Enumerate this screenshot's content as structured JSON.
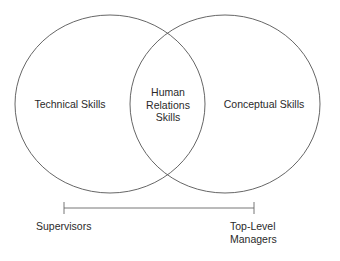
{
  "diagram": {
    "type": "venn",
    "circles": [
      {
        "id": "left",
        "label": "Technical Skills"
      },
      {
        "id": "right",
        "label": "Conceptual Skills"
      }
    ],
    "intersection": {
      "lines": [
        "Human",
        "Relations",
        "Skills"
      ]
    },
    "scale": {
      "left_label": "Supervisors",
      "right_label_lines": [
        "Top-Level",
        "Managers"
      ]
    },
    "colors": {
      "stroke": "#555555",
      "text": "#2a2a2a",
      "background": "#ffffff"
    }
  }
}
